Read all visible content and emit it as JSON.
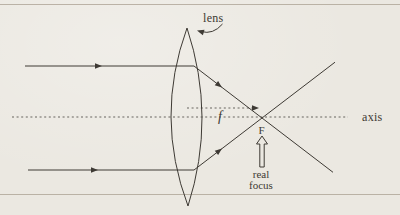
{
  "diagram": {
    "labels": {
      "lens": "lens",
      "axis": "axis",
      "focal_length": "f",
      "focus_point": "F",
      "real_focus_line1": "real",
      "real_focus_line2": "focus"
    },
    "colors": {
      "paper": "#ebe8e1",
      "ink": "#3e3a34",
      "page_rule": "#b4ac9e"
    }
  }
}
